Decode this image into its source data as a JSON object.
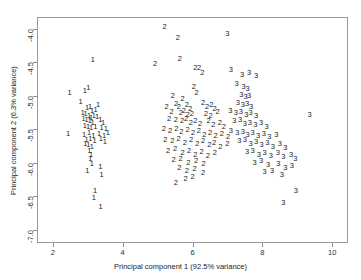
{
  "chart_data": {
    "type": "scatter",
    "title": "",
    "xlabel": "Principal component 1 (92.5% variance)",
    "ylabel": "Principal component 2 (6.3% variance)",
    "xlim": [
      1.55,
      10.45
    ],
    "ylim": [
      -7.2,
      -3.82
    ],
    "xticks": [
      2,
      4,
      6,
      8,
      10
    ],
    "xticklabels": [
      "2",
      "4",
      "6",
      "8",
      "10"
    ],
    "yticks": [
      -4.0,
      -4.5,
      -5.0,
      -5.5,
      -6.0,
      -6.5,
      -7.0
    ],
    "yticklabels": [
      "-4.0",
      "-4.5",
      "-5.0",
      "-5.5",
      "-6.0",
      "-6.5",
      "-7.0"
    ],
    "grid": false,
    "legend": "none",
    "point_marker": "group-label-text",
    "groups": [
      "1",
      "2",
      "3"
    ],
    "series": [
      {
        "name": "1",
        "label": "1",
        "points": [
          [
            3.15,
            -4.47
          ],
          [
            2.48,
            -4.96
          ],
          [
            2.92,
            -4.93
          ],
          [
            3.02,
            -4.88
          ],
          [
            2.8,
            -5.09
          ],
          [
            2.98,
            -5.18
          ],
          [
            3.07,
            -5.16
          ],
          [
            3.13,
            -5.22
          ],
          [
            3.23,
            -5.21
          ],
          [
            3.3,
            -5.13
          ],
          [
            2.86,
            -5.26
          ],
          [
            2.94,
            -5.27
          ],
          [
            3.04,
            -5.3
          ],
          [
            3.1,
            -5.33
          ],
          [
            3.18,
            -5.3
          ],
          [
            3.27,
            -5.31
          ],
          [
            2.88,
            -5.34
          ],
          [
            2.97,
            -5.36
          ],
          [
            3.06,
            -5.38
          ],
          [
            3.14,
            -5.4
          ],
          [
            3.36,
            -5.36
          ],
          [
            3.44,
            -5.4
          ],
          [
            2.92,
            -5.45
          ],
          [
            3.01,
            -5.46
          ],
          [
            3.1,
            -5.48
          ],
          [
            3.22,
            -5.47
          ],
          [
            3.4,
            -5.48
          ],
          [
            3.52,
            -5.49
          ],
          [
            2.44,
            -5.57
          ],
          [
            2.9,
            -5.58
          ],
          [
            3.04,
            -5.56
          ],
          [
            3.16,
            -5.6
          ],
          [
            3.33,
            -5.57
          ],
          [
            3.47,
            -5.6
          ],
          [
            3.58,
            -5.56
          ],
          [
            2.97,
            -5.66
          ],
          [
            3.08,
            -5.64
          ],
          [
            3.2,
            -5.68
          ],
          [
            3.38,
            -5.65
          ],
          [
            3.49,
            -5.69
          ],
          [
            2.93,
            -5.72
          ],
          [
            3.02,
            -5.74
          ],
          [
            3.12,
            -5.76
          ],
          [
            3.05,
            -5.83
          ],
          [
            3.1,
            -5.88
          ],
          [
            3.08,
            -5.95
          ],
          [
            3.12,
            -6.02
          ],
          [
            2.99,
            -6.12
          ],
          [
            3.36,
            -6.07
          ],
          [
            3.4,
            -6.18
          ],
          [
            3.21,
            -6.42
          ],
          [
            3.18,
            -6.52
          ],
          [
            3.37,
            -6.66
          ]
        ]
      },
      {
        "name": "2",
        "label": "2",
        "points": [
          [
            5.2,
            -3.97
          ],
          [
            5.58,
            -4.13
          ],
          [
            5.64,
            -4.45
          ],
          [
            4.93,
            -4.53
          ],
          [
            6.08,
            -4.59
          ],
          [
            6.19,
            -4.58
          ],
          [
            6.28,
            -4.66
          ],
          [
            6.04,
            -4.86
          ],
          [
            6.12,
            -4.95
          ],
          [
            5.44,
            -5.0
          ],
          [
            5.72,
            -5.04
          ],
          [
            5.53,
            -5.12
          ],
          [
            5.26,
            -5.17
          ],
          [
            5.61,
            -5.16
          ],
          [
            5.84,
            -5.14
          ],
          [
            5.93,
            -5.19
          ],
          [
            5.4,
            -5.24
          ],
          [
            5.67,
            -5.25
          ],
          [
            5.75,
            -5.23
          ],
          [
            5.86,
            -5.28
          ],
          [
            5.98,
            -5.27
          ],
          [
            6.3,
            -5.1
          ],
          [
            6.42,
            -5.16
          ],
          [
            6.54,
            -5.13
          ],
          [
            6.63,
            -5.19
          ],
          [
            6.38,
            -5.27
          ],
          [
            6.52,
            -5.3
          ],
          [
            6.72,
            -5.24
          ],
          [
            5.33,
            -5.35
          ],
          [
            5.52,
            -5.36
          ],
          [
            5.7,
            -5.38
          ],
          [
            5.82,
            -5.34
          ],
          [
            5.95,
            -5.4
          ],
          [
            6.08,
            -5.37
          ],
          [
            6.22,
            -5.42
          ],
          [
            6.46,
            -5.38
          ],
          [
            6.6,
            -5.44
          ],
          [
            6.78,
            -5.4
          ],
          [
            6.9,
            -5.46
          ],
          [
            5.18,
            -5.5
          ],
          [
            5.36,
            -5.52
          ],
          [
            5.54,
            -5.49
          ],
          [
            5.68,
            -5.54
          ],
          [
            5.86,
            -5.51
          ],
          [
            6.02,
            -5.56
          ],
          [
            6.18,
            -5.53
          ],
          [
            6.34,
            -5.58
          ],
          [
            6.5,
            -5.55
          ],
          [
            6.66,
            -5.6
          ],
          [
            6.84,
            -5.57
          ],
          [
            7.02,
            -5.62
          ],
          [
            5.22,
            -5.66
          ],
          [
            5.42,
            -5.68
          ],
          [
            5.6,
            -5.64
          ],
          [
            5.78,
            -5.7
          ],
          [
            5.96,
            -5.66
          ],
          [
            6.14,
            -5.72
          ],
          [
            6.3,
            -5.68
          ],
          [
            6.48,
            -5.74
          ],
          [
            6.62,
            -5.7
          ],
          [
            6.8,
            -5.76
          ],
          [
            7.0,
            -5.72
          ],
          [
            5.3,
            -5.82
          ],
          [
            5.5,
            -5.8
          ],
          [
            5.72,
            -5.86
          ],
          [
            5.9,
            -5.82
          ],
          [
            6.08,
            -5.88
          ],
          [
            6.26,
            -5.84
          ],
          [
            6.44,
            -5.9
          ],
          [
            6.64,
            -5.86
          ],
          [
            5.46,
            -5.96
          ],
          [
            5.66,
            -5.94
          ],
          [
            5.88,
            -6.0
          ],
          [
            6.1,
            -5.97
          ],
          [
            6.32,
            -6.02
          ],
          [
            5.62,
            -6.08
          ],
          [
            5.84,
            -6.12
          ],
          [
            6.06,
            -6.1
          ],
          [
            6.3,
            -6.16
          ],
          [
            5.8,
            -6.24
          ],
          [
            6.0,
            -6.22
          ],
          [
            5.52,
            -6.3
          ]
        ]
      },
      {
        "name": "3",
        "label": "3",
        "points": [
          [
            7.0,
            -4.07
          ],
          [
            7.1,
            -4.62
          ],
          [
            7.42,
            -4.68
          ],
          [
            7.62,
            -4.66
          ],
          [
            7.82,
            -4.7
          ],
          [
            7.26,
            -4.82
          ],
          [
            7.46,
            -4.86
          ],
          [
            7.58,
            -4.9
          ],
          [
            7.4,
            -4.98
          ],
          [
            7.52,
            -5.02
          ],
          [
            7.62,
            -5.0
          ],
          [
            7.3,
            -5.1
          ],
          [
            7.44,
            -5.14
          ],
          [
            7.56,
            -5.12
          ],
          [
            7.68,
            -5.16
          ],
          [
            7.08,
            -5.22
          ],
          [
            7.24,
            -5.26
          ],
          [
            7.38,
            -5.24
          ],
          [
            7.54,
            -5.28
          ],
          [
            7.66,
            -5.25
          ],
          [
            7.82,
            -5.3
          ],
          [
            9.35,
            -5.28
          ],
          [
            7.2,
            -5.38
          ],
          [
            7.36,
            -5.36
          ],
          [
            7.5,
            -5.42
          ],
          [
            7.64,
            -5.4
          ],
          [
            7.8,
            -5.44
          ],
          [
            7.96,
            -5.4
          ],
          [
            8.12,
            -5.46
          ],
          [
            7.1,
            -5.52
          ],
          [
            7.28,
            -5.56
          ],
          [
            7.44,
            -5.54
          ],
          [
            7.58,
            -5.58
          ],
          [
            7.72,
            -5.55
          ],
          [
            7.88,
            -5.6
          ],
          [
            8.04,
            -5.57
          ],
          [
            8.2,
            -5.62
          ],
          [
            8.4,
            -5.58
          ],
          [
            7.34,
            -5.68
          ],
          [
            7.5,
            -5.66
          ],
          [
            7.66,
            -5.72
          ],
          [
            7.82,
            -5.69
          ],
          [
            7.98,
            -5.74
          ],
          [
            8.14,
            -5.7
          ],
          [
            8.3,
            -5.76
          ],
          [
            8.5,
            -5.72
          ],
          [
            8.66,
            -5.78
          ],
          [
            7.56,
            -5.84
          ],
          [
            7.72,
            -5.82
          ],
          [
            7.9,
            -5.88
          ],
          [
            8.06,
            -5.85
          ],
          [
            8.24,
            -5.9
          ],
          [
            8.44,
            -5.86
          ],
          [
            8.6,
            -5.92
          ],
          [
            8.82,
            -5.88
          ],
          [
            8.94,
            -5.94
          ],
          [
            7.78,
            -6.0
          ],
          [
            7.96,
            -5.98
          ],
          [
            8.16,
            -6.04
          ],
          [
            8.46,
            -6.02
          ],
          [
            8.66,
            -6.08
          ],
          [
            8.84,
            -6.05
          ],
          [
            8.06,
            -6.14
          ],
          [
            8.28,
            -6.12
          ],
          [
            8.56,
            -6.18
          ],
          [
            8.96,
            -6.42
          ],
          [
            8.6,
            -6.6
          ]
        ]
      }
    ]
  },
  "axes": {
    "xlabel": "Principal component 1 (92.5% variance)",
    "ylabel": "Principal component 2 (6.3% variance)"
  }
}
